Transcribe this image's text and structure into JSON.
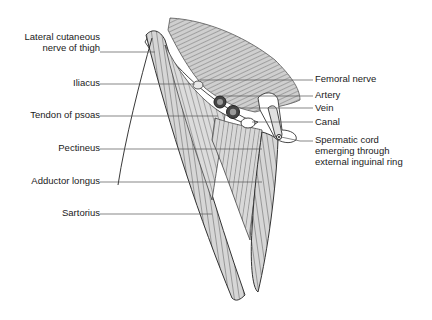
{
  "figure": {
    "type": "anatomical-illustration"
  },
  "labels_left": [
    {
      "id": "lateral-cutaneous-nerve",
      "line1": "Lateral cutaneous",
      "line2": "nerve of thigh"
    },
    {
      "id": "iliacus",
      "line1": "Iliacus"
    },
    {
      "id": "tendon-of-psoas",
      "line1": "Tendon of psoas"
    },
    {
      "id": "pectineus",
      "line1": "Pectineus"
    },
    {
      "id": "adductor-longus",
      "line1": "Adductor longus"
    },
    {
      "id": "sartorius",
      "line1": "Sartorius"
    }
  ],
  "labels_right": [
    {
      "id": "femoral-nerve",
      "line1": "Femoral nerve"
    },
    {
      "id": "artery",
      "line1": "Artery"
    },
    {
      "id": "vein",
      "line1": "Vein"
    },
    {
      "id": "canal",
      "line1": "Canal"
    },
    {
      "id": "spermatic-cord",
      "line1": "Spermatic cord",
      "line2": "emerging through",
      "line3": "external inguinal ring"
    }
  ],
  "colors": {
    "background": "#ffffff",
    "muscle_fill": "#d9d9d9",
    "stroke": "#333333",
    "leader_line": "#555555",
    "text": "#1a1a1a"
  }
}
